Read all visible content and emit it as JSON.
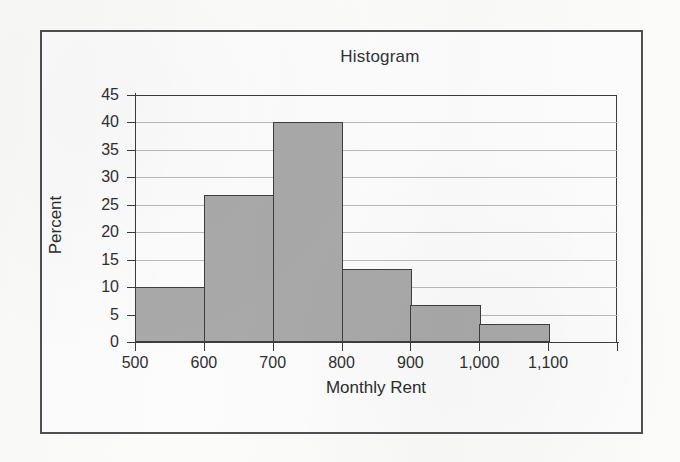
{
  "chart_data": {
    "type": "bar",
    "title": "Histogram",
    "xlabel": "Monthly Rent",
    "ylabel": "Percent",
    "grid": true,
    "legend": false,
    "xlim": [
      500,
      1200
    ],
    "ylim": [
      0,
      45
    ],
    "bin_width": 100,
    "x_tick_labels": [
      "500",
      "600",
      "700",
      "800",
      "900",
      "1,000",
      "1,100"
    ],
    "x_tick_values": [
      500,
      600,
      700,
      800,
      900,
      1000,
      1100
    ],
    "y_tick_labels": [
      "45",
      "40",
      "35",
      "30",
      "25",
      "20",
      "15",
      "10",
      "5",
      "0"
    ],
    "y_tick_values": [
      45,
      40,
      35,
      30,
      25,
      20,
      15,
      10,
      5,
      0
    ],
    "categories": [
      "500-600",
      "600-700",
      "700-800",
      "800-900",
      "900-1,000",
      "1,000-1,100"
    ],
    "bin_edges": [
      500,
      600,
      700,
      800,
      900,
      1000,
      1100
    ],
    "values": [
      10,
      26.7,
      40,
      13.3,
      6.7,
      3.3
    ],
    "bar_fill_color": "#a9a9a9",
    "bar_edge_color": "#3d3e40",
    "gridline_color": "#b9b9b9",
    "axis_color": "#3a3b3d",
    "background_color": "#fbfbfa"
  }
}
